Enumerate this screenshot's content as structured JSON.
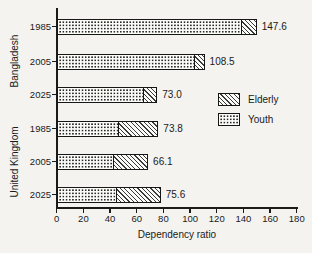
{
  "figure": {
    "xlabel": "Dependency ratio",
    "ink_color": "#1a1a1a",
    "background_color": "#f4f3f0"
  },
  "chart_data": {
    "type": "bar",
    "orientation": "horizontal",
    "stacked": true,
    "title": "",
    "xlabel": "Dependency ratio",
    "ylabel": "",
    "xlim": [
      0,
      180
    ],
    "xticks": [
      0,
      20,
      40,
      60,
      80,
      100,
      120,
      140,
      160,
      180
    ],
    "grid": false,
    "legend_position": "middle-right",
    "series_legend": [
      {
        "name": "Elderly",
        "pattern": "diagonal-hatch"
      },
      {
        "name": "Youth",
        "pattern": "dots"
      }
    ],
    "groups": [
      {
        "country": "Bangladesh",
        "rows": [
          {
            "year": "1985",
            "total": 147.6,
            "label": "147.6",
            "youth": 137.6,
            "elderly": 10.0
          },
          {
            "year": "2005",
            "total": 108.5,
            "label": "108.5",
            "youth": 102.5,
            "elderly": 6.0
          },
          {
            "year": "2025",
            "total": 73.0,
            "label": "73.0",
            "youth": 64.0,
            "elderly": 9.0
          }
        ]
      },
      {
        "country": "United Kingdom",
        "rows": [
          {
            "year": "1985",
            "total": 73.8,
            "label": "73.8",
            "youth": 45.0,
            "elderly": 28.8
          },
          {
            "year": "2005",
            "total": 66.1,
            "label": "66.1",
            "youth": 41.5,
            "elderly": 24.6
          },
          {
            "year": "2025",
            "total": 75.6,
            "label": "75.6",
            "youth": 44.0,
            "elderly": 31.6
          }
        ]
      }
    ]
  }
}
